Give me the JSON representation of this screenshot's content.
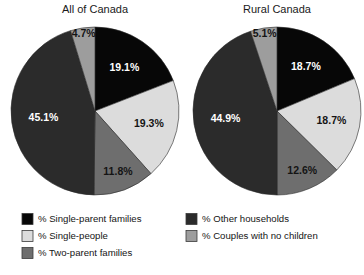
{
  "figure": {
    "background": "#ffffff",
    "text_color": "#141414"
  },
  "palette": {
    "single_parent_families": "#070707",
    "single_people": "#dcdcdc",
    "two_parent_families": "#6e6e6e",
    "other_households": "#2b2b2b",
    "couples_no_children": "#9d9d9d"
  },
  "legend": {
    "items": [
      {
        "label": "% Single-parent families",
        "color": "#070707",
        "column": 0
      },
      {
        "label": "% Single-people",
        "color": "#dcdcdc",
        "column": 0
      },
      {
        "label": "% Two-parent families",
        "color": "#6e6e6e",
        "column": 0
      },
      {
        "label": "% Other households",
        "color": "#2b2b2b",
        "column": 1
      },
      {
        "label": "% Couples with no children",
        "color": "#9d9d9d",
        "column": 1
      }
    ]
  },
  "chart_data": [
    {
      "type": "pie",
      "title": "All of Canada",
      "center": [
        95,
        111
      ],
      "radius": 84,
      "start_angle": 0,
      "direction": "clockwise",
      "categories": [
        "% Single-parent families",
        "% Single-people",
        "% Two-parent families",
        "% Other households",
        "% Couples with no children"
      ],
      "values": [
        19.1,
        19.3,
        11.8,
        45.1,
        4.7
      ],
      "labels": [
        "19.1%",
        "19.3%",
        "11.8%",
        "45.1%",
        "4.7%"
      ],
      "colors": [
        "#070707",
        "#dcdcdc",
        "#6e6e6e",
        "#2b2b2b",
        "#9d9d9d"
      ],
      "label_colors": [
        "#ffffff",
        "#141414",
        "#141414",
        "#ffffff",
        "#141414"
      ],
      "label_radius_factor": [
        0.62,
        0.66,
        0.78,
        0.62,
        0.92
      ]
    },
    {
      "type": "pie",
      "title": "Rural Canada",
      "center": [
        277,
        111
      ],
      "radius": 84,
      "start_angle": 0,
      "direction": "clockwise",
      "categories": [
        "% Single-parent families",
        "% Single-people",
        "% Two-parent families",
        "% Other households",
        "% Couples with no children"
      ],
      "values": [
        18.7,
        18.7,
        12.6,
        44.9,
        5.1
      ],
      "labels": [
        "18.7%",
        "18.7%",
        "12.6%",
        "44.9%",
        "5.1%"
      ],
      "colors": [
        "#070707",
        "#dcdcdc",
        "#6e6e6e",
        "#2b2b2b",
        "#9d9d9d"
      ],
      "label_colors": [
        "#ffffff",
        "#141414",
        "#141414",
        "#ffffff",
        "#141414"
      ],
      "label_radius_factor": [
        0.62,
        0.66,
        0.78,
        0.62,
        0.92
      ]
    }
  ]
}
